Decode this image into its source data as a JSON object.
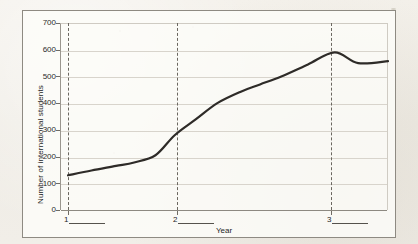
{
  "figure": {
    "background_color": "#f2efe9",
    "plot_background": "#fdfcf9",
    "border_color": "#8e8a82"
  },
  "chart_data": {
    "type": "line",
    "title": "",
    "subtitle": "",
    "xlabel": "Year",
    "ylabel": "Number of international students",
    "ylim": [
      0,
      700
    ],
    "ytick_labels": [
      "0",
      "100",
      "200",
      "300",
      "400",
      "500",
      "600",
      "700"
    ],
    "ytick_values": [
      0,
      100,
      200,
      300,
      400,
      500,
      600,
      700
    ],
    "grid": true,
    "legend": "none",
    "line_color": "#2e2b28",
    "line_width": 2.2,
    "marked_years": [
      {
        "label": "1",
        "blank": "________"
      },
      {
        "label": "2",
        "blank": "________"
      },
      {
        "label": "3",
        "blank": "________"
      }
    ],
    "x": [
      1.0,
      1.25,
      1.55,
      1.8,
      2.0,
      2.25,
      2.5,
      2.75,
      3.0,
      3.2,
      3.45
    ],
    "values": [
      130,
      150,
      172,
      205,
      280,
      345,
      405,
      450,
      482,
      520,
      590
    ],
    "series": [
      {
        "name": "International students",
        "points": [
          {
            "x": 1.0,
            "y": 130
          },
          {
            "x": 1.22,
            "y": 148
          },
          {
            "x": 1.45,
            "y": 165
          },
          {
            "x": 1.62,
            "y": 178
          },
          {
            "x": 1.82,
            "y": 205
          },
          {
            "x": 2.0,
            "y": 280
          },
          {
            "x": 2.2,
            "y": 340
          },
          {
            "x": 2.4,
            "y": 400
          },
          {
            "x": 2.62,
            "y": 443
          },
          {
            "x": 2.8,
            "y": 470
          },
          {
            "x": 3.0,
            "y": 500
          },
          {
            "x": 3.25,
            "y": 545
          },
          {
            "x": 3.5,
            "y": 590
          },
          {
            "x": 3.72,
            "y": 550
          },
          {
            "x": 4.0,
            "y": 557
          }
        ]
      }
    ],
    "annotations": {
      "peak_value": 590,
      "start_value": 130,
      "end_value": 557
    }
  }
}
